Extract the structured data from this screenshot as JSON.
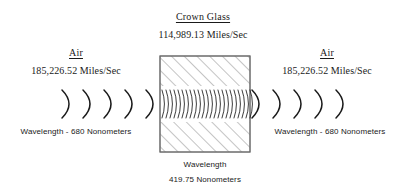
{
  "diagram": {
    "background_color": "#ffffff",
    "ink_color": "#1a1a1a",
    "hatch_color": "#808080",
    "block_border_color": "#666666"
  },
  "medium_center": {
    "name": "Crown Glass",
    "speed": "114,989.13 Miles/Sec",
    "wavelength_label": "Wavelength",
    "wavelength_value": "419.75  Nonometers",
    "wavefront_count": 24
  },
  "medium_left": {
    "name": "Air",
    "speed": "185,226.52 Miles/Sec",
    "wavelength": "Wavelength - 680 Nonometers",
    "wavefront_count": 5
  },
  "medium_right": {
    "name": "Air",
    "speed": "185,226.52 Miles/Sec",
    "wavelength": "Wavelength - 680 Nonometers",
    "wavefront_count": 5
  },
  "icons": {
    "glass_block": "glass-block-icon",
    "wavefront": "wavefront-chevron-icon"
  }
}
